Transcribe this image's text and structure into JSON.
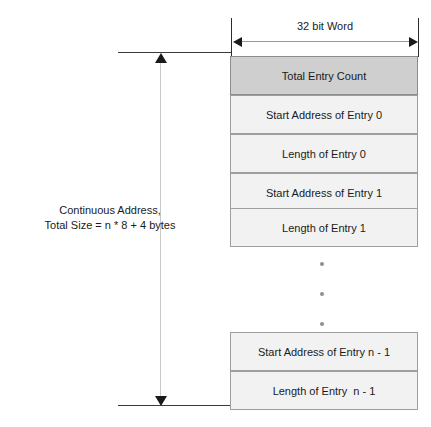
{
  "diagram": {
    "width_dimension": {
      "label": "32 bit Word"
    },
    "height_dimension": {
      "caption_line1": "Continuous Address,",
      "caption_line2": "Total Size = n * 8 + 4 bytes"
    },
    "rows": [
      {
        "label": "Total Entry Count",
        "style": "shaded"
      },
      {
        "label": "Start Address of Entry 0",
        "style": "normal"
      },
      {
        "label": "Length of Entry 0",
        "style": "normal"
      },
      {
        "label": "Start Address of Entry 1",
        "style": "normal"
      },
      {
        "label": "Length of Entry 1",
        "style": "normal"
      },
      {
        "label": "Start Address of Entry n - 1",
        "style": "normal"
      },
      {
        "label": "Length of Entry  n - 1",
        "style": "normal"
      }
    ],
    "ellipsis": "• • •",
    "colors": {
      "shaded_row": "#cfcfcf",
      "row_fill": "#f2f2f2",
      "row_border": "#9e9e9e",
      "arrow": "#1a1a1a",
      "dimension_line": "#c9c9c9",
      "text": "#1a1a1a"
    }
  }
}
